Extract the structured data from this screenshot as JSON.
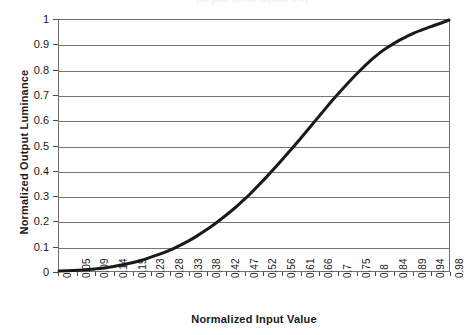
{
  "top_caption": "(illegible cut-off caption text)",
  "chart_data": {
    "type": "line",
    "title": "",
    "xlabel": "Normalized Input Value",
    "ylabel": "Normalized Output Luminance",
    "xlim": [
      0,
      1
    ],
    "ylim": [
      0,
      1
    ],
    "grid": true,
    "grid_axis": "y",
    "legend": "none",
    "line_color": "#1a1a1a",
    "line_width": 3,
    "gridline_color": "#757575",
    "frame_color": "#6e6e6e",
    "background_color": "#ffffff",
    "x_tick_labels": [
      "0",
      "0.05",
      "0.09",
      "0.14",
      "0.19",
      "0.23",
      "0.28",
      "0.33",
      "0.38",
      "0.42",
      "0.47",
      "0.52",
      "0.56",
      "0.61",
      "0.66",
      "0.7",
      "0.75",
      "0.8",
      "0.84",
      "0.89",
      "0.94",
      "0.98"
    ],
    "x_tick_values": [
      0,
      0.05,
      0.09,
      0.14,
      0.19,
      0.23,
      0.28,
      0.33,
      0.38,
      0.42,
      0.47,
      0.52,
      0.56,
      0.61,
      0.66,
      0.7,
      0.75,
      0.8,
      0.84,
      0.89,
      0.94,
      0.98
    ],
    "y_tick_labels": [
      "0",
      "0.1",
      "0.2",
      "0.3",
      "0.4",
      "0.5",
      "0.6",
      "0.7",
      "0.8",
      "0.9",
      "1"
    ],
    "y_tick_values": [
      0,
      0.1,
      0.2,
      0.3,
      0.4,
      0.5,
      0.6,
      0.7,
      0.8,
      0.9,
      1
    ],
    "series": [
      {
        "name": "Tone response curve",
        "x": [
          0,
          0.02,
          0.05,
          0.07,
          0.09,
          0.12,
          0.14,
          0.16,
          0.19,
          0.21,
          0.23,
          0.26,
          0.28,
          0.3,
          0.33,
          0.35,
          0.38,
          0.4,
          0.42,
          0.45,
          0.47,
          0.49,
          0.52,
          0.54,
          0.56,
          0.59,
          0.61,
          0.63,
          0.66,
          0.68,
          0.7,
          0.72,
          0.75,
          0.77,
          0.8,
          0.82,
          0.84,
          0.87,
          0.89,
          0.91,
          0.94,
          0.96,
          0.98,
          1.0
        ],
        "y": [
          0.0,
          0.001,
          0.003,
          0.005,
          0.008,
          0.013,
          0.018,
          0.024,
          0.034,
          0.042,
          0.052,
          0.068,
          0.08,
          0.094,
          0.118,
          0.136,
          0.166,
          0.188,
          0.212,
          0.25,
          0.278,
          0.307,
          0.355,
          0.388,
          0.422,
          0.475,
          0.511,
          0.548,
          0.604,
          0.641,
          0.678,
          0.713,
          0.764,
          0.796,
          0.84,
          0.866,
          0.888,
          0.917,
          0.933,
          0.948,
          0.966,
          0.977,
          0.988,
          1.0
        ]
      }
    ]
  }
}
